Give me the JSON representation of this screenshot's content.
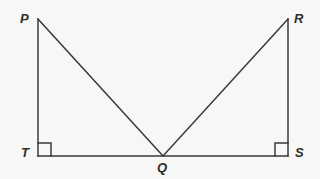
{
  "figure": {
    "type": "geometry-diagram",
    "canvas": {
      "width": 320,
      "height": 179
    },
    "style": {
      "background_color": "#f7f7f5",
      "stroke_color": "#3a3a3a",
      "stroke_width": 1.5,
      "label_color": "#2e2e2e"
    },
    "points": {
      "P": {
        "label": "P",
        "x": 38,
        "y": 19
      },
      "R": {
        "label": "R",
        "x": 288,
        "y": 19
      },
      "T": {
        "label": "T",
        "x": 38,
        "y": 156
      },
      "S": {
        "label": "S",
        "x": 288,
        "y": 156
      },
      "Q": {
        "label": "Q",
        "x": 163,
        "y": 156
      }
    },
    "segments": [
      {
        "name": "PT",
        "from": "P",
        "to": "T",
        "d": "M 38 19 L 38 156"
      },
      {
        "name": "TS",
        "from": "T",
        "to": "S",
        "d": "M 38 156 L 288 156"
      },
      {
        "name": "RS",
        "from": "R",
        "to": "S",
        "d": "M 288 19 L 288 156"
      },
      {
        "name": "PQ",
        "from": "P",
        "to": "Q",
        "d": "M 38 19 L 163 156"
      },
      {
        "name": "QR",
        "from": "Q",
        "to": "R",
        "d": "M 163 156 L 288 19"
      }
    ],
    "right_angles": [
      {
        "name": "angle-T",
        "at": "T",
        "d": "M 38 143 L 51 143 L 51 156"
      },
      {
        "name": "angle-S",
        "at": "S",
        "d": "M 288 143 L 275 143 L 275 156"
      }
    ]
  }
}
